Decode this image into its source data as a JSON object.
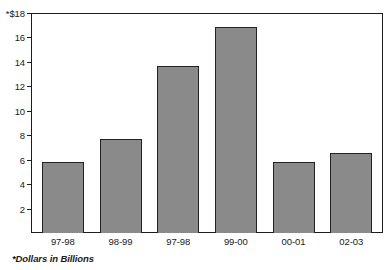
{
  "chart_data": {
    "type": "bar",
    "title": "",
    "title_cut_off": true,
    "categories": [
      "97-98",
      "98-99",
      "97-98",
      "99-00",
      "00-01",
      "02-03"
    ],
    "values": [
      5.8,
      7.75,
      13.7,
      16.9,
      5.85,
      6.55
    ],
    "series": [
      {
        "name": "Dollars in Billions",
        "values": [
          5.8,
          7.75,
          13.7,
          16.9,
          5.85,
          6.55
        ]
      }
    ],
    "xlabel": "",
    "ylabel": "",
    "ylim": [
      0,
      18
    ],
    "yticks": [
      2,
      4,
      6,
      8,
      10,
      12,
      14,
      16,
      18
    ],
    "ytick_labels": [
      "2",
      "4",
      "6",
      "8",
      "10",
      "12",
      "14",
      "16",
      "*$18"
    ],
    "grid": false,
    "legend": false,
    "bar_color": "#8a8a8a",
    "bar_border_color": "#222222",
    "axis_color": "#1c1c1c",
    "text_color": "#1a1a1a",
    "footnote": "*Dollars in Billions"
  },
  "axis": {
    "y_labels": [
      "*$18",
      "16",
      "14",
      "12",
      "10",
      "8",
      "6",
      "4",
      "2"
    ],
    "y_values": [
      18,
      16,
      14,
      12,
      10,
      8,
      6,
      4,
      2
    ],
    "x_labels": [
      "97-98",
      "98-99",
      "97-98",
      "99-00",
      "00-01",
      "02-03"
    ]
  },
  "footnote": {
    "text": "*Dollars in Billions"
  },
  "title": {
    "text": ""
  }
}
